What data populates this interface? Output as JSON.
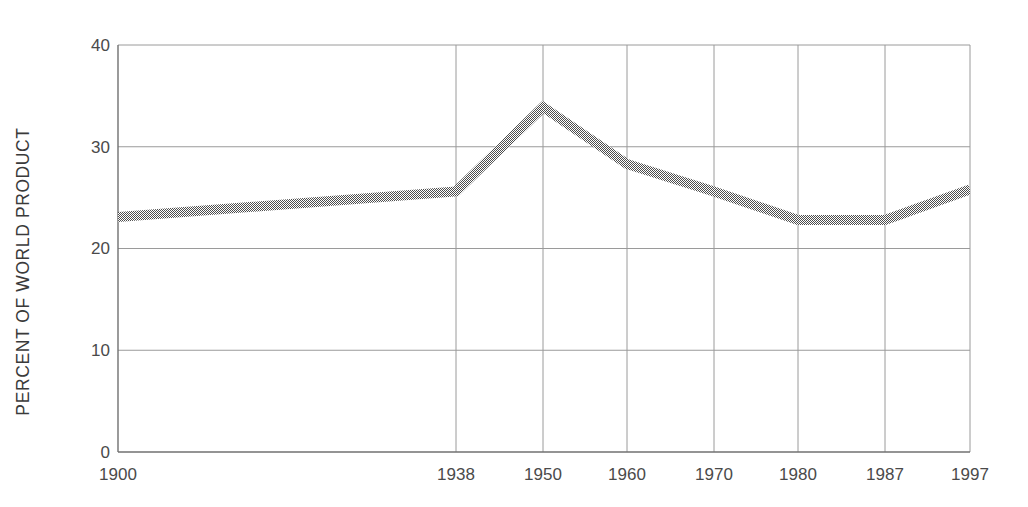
{
  "chart_data": {
    "type": "line",
    "title": "",
    "subtitle": "",
    "xlabel": "",
    "ylabel": "PERCENT OF WORLD PRODUCT",
    "categories": [
      "1900",
      "1938",
      "1950",
      "1960",
      "1970",
      "1980",
      "1987",
      "1997"
    ],
    "x": [
      1900,
      1938,
      1950,
      1960,
      1970,
      1980,
      1987,
      1997
    ],
    "values": [
      23.1,
      25.6,
      33.9,
      28.3,
      25.6,
      22.8,
      22.8,
      25.8
    ],
    "series": [
      {
        "name": "Percent of world product",
        "values": [
          23.1,
          25.6,
          33.9,
          28.3,
          25.6,
          22.8,
          22.8,
          25.8
        ]
      }
    ],
    "ylim": [
      0,
      40
    ],
    "yticks": [
      0,
      10,
      20,
      30,
      40
    ],
    "ytick_labels": [
      "0",
      "10",
      "20",
      "30",
      "40"
    ],
    "xtick_labels": [
      "1900",
      "1938",
      "1950",
      "1960",
      "1970",
      "1980",
      "1987",
      "1997"
    ],
    "x_axis_scale": "categorical-uneven",
    "grid": {
      "horizontal": true,
      "vertical": true,
      "color": "#9a9a9a"
    },
    "legend": {
      "visible": false,
      "position": "none"
    },
    "annotations": [],
    "colors": {
      "line": "#666666",
      "line_fill_pattern": "halftone-checker-gray",
      "axis": "#707070",
      "grid": "#a0a0a0",
      "text": "#444444",
      "background": "#ffffff"
    },
    "line_style": {
      "width_px": 10,
      "pattern": "dithered-halftone"
    }
  },
  "plot_geometry": {
    "left_px": 118,
    "right_px": 970,
    "top_px": 45,
    "bottom_px": 452,
    "xtick_px": [
      118,
      456,
      543,
      627,
      714,
      798,
      885,
      970
    ],
    "ytick_px": [
      452,
      350,
      248,
      147,
      45
    ]
  }
}
